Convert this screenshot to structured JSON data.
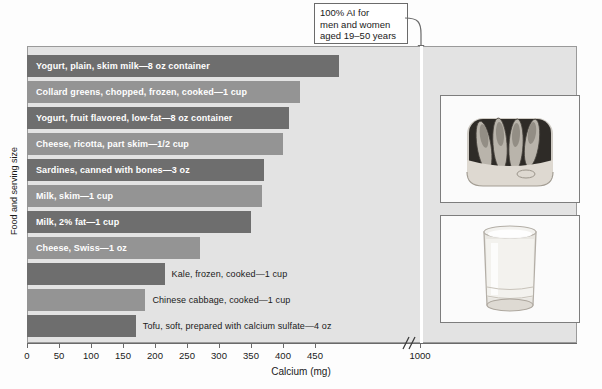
{
  "figure": {
    "xlabel": "Calcium (mg)",
    "ylabel": "Food and serving size",
    "callout": {
      "line1": "100% AI for",
      "line2": "men and women",
      "line3": "aged 19–50 years",
      "value": 1000
    },
    "photos": [
      {
        "name": "sardines-can-photo",
        "caption": "canned sardines"
      },
      {
        "name": "glass-of-milk-photo",
        "caption": "glass of milk"
      }
    ]
  },
  "colors": {
    "bar_dark": "#6e6e6e",
    "bar_light": "#949494",
    "plot_background": "#e3e3e3",
    "reference_line": "#ffffff",
    "axis": "#6a6a6a"
  },
  "chart_data": {
    "type": "bar",
    "orientation": "horizontal",
    "title": "",
    "xlabel": "Calcium (mg)",
    "ylabel": "Food and serving size",
    "xlim": [
      0,
      500
    ],
    "xticks": [
      0,
      50,
      100,
      150,
      200,
      250,
      300,
      350,
      400,
      450,
      1000
    ],
    "xticklabels": [
      "0",
      "50",
      "100",
      "150",
      "200",
      "250",
      "300",
      "350",
      "400",
      "450",
      "1000"
    ],
    "axis_break_after": 450,
    "grid": false,
    "legend": "none",
    "annotations": [
      {
        "text": "100% AI for men and women aged 19–50 years",
        "x": 1000,
        "type": "reference-line"
      }
    ],
    "categories": [
      "Yogurt, plain, skim milk—8 oz container",
      "Collard greens, chopped, frozen, cooked—1 cup",
      "Yogurt, fruit flavored, low-fat—8 oz container",
      "Cheese, ricotta, part skim—1/2 cup",
      "Sardines, canned with bones—3 oz",
      "Milk, skim—1 cup",
      "Milk, 2% fat—1 cup",
      "Cheese, Swiss—1 oz",
      "Kale, frozen, cooked—1 cup",
      "Chinese cabbage, cooked—1 cup",
      "Tofu, soft, prepared with calcium sulfate—4 oz"
    ],
    "values": [
      488,
      426,
      410,
      400,
      370,
      367,
      350,
      270,
      215,
      185,
      170
    ]
  },
  "bars": [
    {
      "label": "Yogurt, plain, skim milk—8 oz container",
      "value": 488,
      "shade": "dark",
      "label_inside": true
    },
    {
      "label": "Collard greens, chopped, frozen, cooked—1 cup",
      "value": 426,
      "shade": "light",
      "label_inside": true
    },
    {
      "label": "Yogurt, fruit flavored, low-fat—8 oz container",
      "value": 410,
      "shade": "dark",
      "label_inside": true
    },
    {
      "label": "Cheese, ricotta, part skim—1/2 cup",
      "value": 400,
      "shade": "light",
      "label_inside": true
    },
    {
      "label": "Sardines, canned with bones—3 oz",
      "value": 370,
      "shade": "dark",
      "label_inside": true
    },
    {
      "label": "Milk, skim—1 cup",
      "value": 367,
      "shade": "light",
      "label_inside": true
    },
    {
      "label": "Milk, 2% fat—1 cup",
      "value": 350,
      "shade": "dark",
      "label_inside": true
    },
    {
      "label": "Cheese, Swiss—1 oz",
      "value": 270,
      "shade": "light",
      "label_inside": true
    },
    {
      "label": "Kale, frozen, cooked—1 cup",
      "value": 215,
      "shade": "dark",
      "label_inside": false
    },
    {
      "label": "Chinese cabbage, cooked—1 cup",
      "value": 185,
      "shade": "light",
      "label_inside": false
    },
    {
      "label": "Tofu, soft, prepared with calcium sulfate—4 oz",
      "value": 170,
      "shade": "dark",
      "label_inside": false
    }
  ]
}
